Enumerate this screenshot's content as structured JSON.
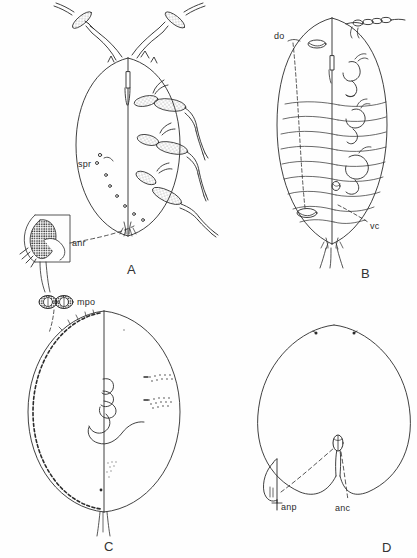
{
  "figure": {
    "background_color": "#fefefe",
    "ink_color": "#2b2b2b",
    "width": 417,
    "height": 558
  },
  "panels": [
    {
      "letter": "A",
      "name": "panel-a",
      "description": "Adult female dorsal/ventral split view with antennae and three pairs of legs",
      "letter_pos": {
        "x": 127,
        "y": 262
      },
      "annotations": [
        {
          "key": "spr",
          "label": "spr",
          "meaning": "spiracle",
          "x": 78,
          "y": 164
        },
        {
          "key": "anr",
          "label": "anr",
          "meaning": "anal ring",
          "x": 72,
          "y": 243
        }
      ]
    },
    {
      "letter": "B",
      "name": "panel-b",
      "description": "Body with segmental lines, dorsal ostiole and ventral cleft",
      "letter_pos": {
        "x": 361,
        "y": 266
      },
      "annotations": [
        {
          "key": "do",
          "label": "do",
          "meaning": "dorsal ostiole",
          "x": 276,
          "y": 37
        },
        {
          "key": "vc",
          "label": "vc",
          "meaning": "ventral cleft",
          "x": 372,
          "y": 227
        }
      ]
    },
    {
      "letter": "C",
      "name": "panel-c",
      "description": "Rounded body with marginal pore row and coiled appendages",
      "letter_pos": {
        "x": 104,
        "y": 539
      },
      "annotations": [
        {
          "key": "mpo",
          "label": "mpo",
          "meaning": "multilocular pore",
          "x": 77,
          "y": 303
        }
      ]
    },
    {
      "letter": "D",
      "name": "panel-d",
      "description": "Heart-shaped body outline with anal plate and anal cleft",
      "letter_pos": {
        "x": 382,
        "y": 540
      },
      "annotations": [
        {
          "key": "anp",
          "label": "anp",
          "meaning": "anal plate",
          "x": 283,
          "y": 508
        },
        {
          "key": "anc",
          "label": "anc",
          "meaning": "anal cleft",
          "x": 337,
          "y": 509
        }
      ]
    }
  ],
  "colors": {
    "ink": "#2b2b2b",
    "line": "#3a3a3a",
    "stipple": "#555555",
    "paper": "#fefefe"
  }
}
